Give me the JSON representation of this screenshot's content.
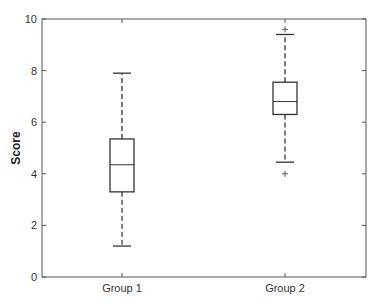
{
  "chart_data": {
    "type": "box",
    "title": "",
    "xlabel": "",
    "ylabel": "Score",
    "ylim": [
      0,
      10
    ],
    "yticks": [
      0,
      2,
      4,
      6,
      8,
      10
    ],
    "categories": [
      "Group 1",
      "Group 2"
    ],
    "grid": false,
    "legend": null,
    "series": [
      {
        "name": "Group 1",
        "whisker_low": 1.2,
        "q1": 3.3,
        "median": 4.35,
        "q3": 5.35,
        "whisker_high": 7.9,
        "outliers": []
      },
      {
        "name": "Group 2",
        "whisker_low": 4.45,
        "q1": 6.3,
        "median": 6.8,
        "q3": 7.55,
        "whisker_high": 9.4,
        "outliers": [
          4.0,
          9.6
        ]
      }
    ]
  },
  "colors": {
    "axis": "#555555",
    "box": "#333333",
    "whisker": "#333333",
    "outlier": "#555555",
    "text": "#333333"
  }
}
